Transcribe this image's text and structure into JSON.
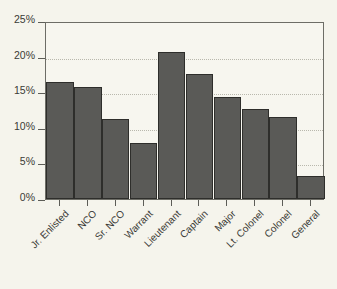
{
  "chart_data": {
    "type": "bar",
    "title": "",
    "xlabel": "",
    "ylabel": "",
    "ylim": [
      0,
      25
    ],
    "grid": true,
    "legend": "none",
    "y_ticks": [
      "0%",
      "5%",
      "10%",
      "15%",
      "20%",
      "25%"
    ],
    "y_tick_values": [
      0,
      5,
      10,
      15,
      20,
      25
    ],
    "categories": [
      "Jr. Enlisted",
      "NCO",
      "Sr. NCO",
      "Warrant",
      "Lieutenant",
      "Captain",
      "Major",
      "Lt. Colonel",
      "Colonel",
      "General"
    ],
    "values": [
      16.5,
      15.8,
      11.3,
      7.8,
      20.6,
      17.6,
      14.3,
      12.6,
      11.5,
      3.3
    ],
    "bar_color": "#5a5a57",
    "bar_edge_color": "#2e2e2b",
    "plot_background": "#f7f6ef",
    "figure_background": "#f5f4ec",
    "gridline_color": "#b9b8ad",
    "axis_color": "#6d6d66"
  }
}
